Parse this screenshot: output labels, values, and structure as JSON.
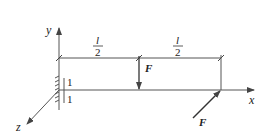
{
  "figure": {
    "type": "cantilever-beam-diagram",
    "colors": {
      "line": "#555555",
      "text": "#222222",
      "background": "#ffffff"
    }
  },
  "axes": {
    "x_label": "x",
    "y_label": "y",
    "z_label": "z"
  },
  "dimensions": [
    {
      "numerator": "l",
      "denominator": "2",
      "position": "left-half"
    },
    {
      "numerator": "l",
      "denominator": "2",
      "position": "right-half"
    }
  ],
  "section_labels": {
    "upper": "1",
    "lower": "1"
  },
  "forces": [
    {
      "label": "F",
      "direction": "vertical-down",
      "location": "mid-span"
    },
    {
      "label": "F",
      "direction": "along-z-toward-tip",
      "location": "free-end"
    }
  ],
  "support": {
    "type": "fixed-wall"
  }
}
